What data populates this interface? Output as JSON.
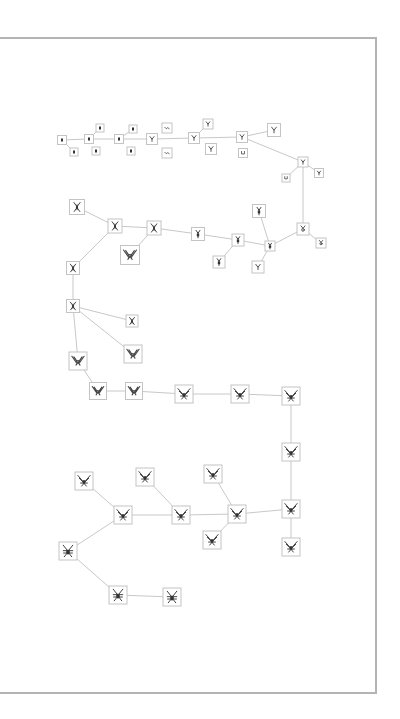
{
  "diagram": {
    "type": "evolution-tree",
    "frame": {
      "border_color": "#b4b4b4",
      "background": "#ffffff"
    },
    "edge_color": "#c8c8c8",
    "node_border_color": "#c4c4c4",
    "glyph_color": "#333333",
    "nodes": [
      {
        "id": "n1",
        "x": 62,
        "y": 140,
        "size": 8,
        "form": "dot"
      },
      {
        "id": "n2",
        "x": 89,
        "y": 139,
        "size": 8,
        "form": "dot"
      },
      {
        "id": "n3",
        "x": 100,
        "y": 128,
        "size": 7,
        "form": "dot"
      },
      {
        "id": "n4",
        "x": 74,
        "y": 152,
        "size": 7,
        "form": "dot"
      },
      {
        "id": "n5",
        "x": 96,
        "y": 151,
        "size": 7,
        "form": "dot"
      },
      {
        "id": "n6",
        "x": 119,
        "y": 139,
        "size": 8,
        "form": "dot"
      },
      {
        "id": "n7",
        "x": 133,
        "y": 129,
        "size": 7,
        "form": "dot"
      },
      {
        "id": "n8",
        "x": 131,
        "y": 151,
        "size": 7,
        "form": "dot"
      },
      {
        "id": "n9",
        "x": 152,
        "y": 139,
        "size": 10,
        "form": "y"
      },
      {
        "id": "n10",
        "x": 167,
        "y": 128,
        "size": 9,
        "form": "wave"
      },
      {
        "id": "n11",
        "x": 167,
        "y": 153,
        "size": 9,
        "form": "wave"
      },
      {
        "id": "n12",
        "x": 194,
        "y": 138,
        "size": 10,
        "form": "y"
      },
      {
        "id": "n13",
        "x": 208,
        "y": 124,
        "size": 9,
        "form": "y"
      },
      {
        "id": "n14",
        "x": 211,
        "y": 149,
        "size": 10,
        "form": "y"
      },
      {
        "id": "n15",
        "x": 242,
        "y": 137,
        "size": 10,
        "form": "y"
      },
      {
        "id": "n16",
        "x": 243,
        "y": 153,
        "size": 8,
        "form": "u"
      },
      {
        "id": "n17",
        "x": 274,
        "y": 130,
        "size": 12,
        "form": "y"
      },
      {
        "id": "n18",
        "x": 303,
        "y": 162,
        "size": 9,
        "form": "y"
      },
      {
        "id": "n19",
        "x": 286,
        "y": 178,
        "size": 7,
        "form": "u"
      },
      {
        "id": "n20",
        "x": 319,
        "y": 173,
        "size": 8,
        "form": "y"
      },
      {
        "id": "n21",
        "x": 303,
        "y": 229,
        "size": 11,
        "form": "ring"
      },
      {
        "id": "n22",
        "x": 321,
        "y": 243,
        "size": 9,
        "form": "ring"
      },
      {
        "id": "n23",
        "x": 270,
        "y": 246,
        "size": 9,
        "form": "stick"
      },
      {
        "id": "n24",
        "x": 259,
        "y": 211,
        "size": 12,
        "form": "stick"
      },
      {
        "id": "n25",
        "x": 258,
        "y": 267,
        "size": 11,
        "form": "y"
      },
      {
        "id": "n26",
        "x": 238,
        "y": 240,
        "size": 11,
        "form": "stick"
      },
      {
        "id": "n27",
        "x": 219,
        "y": 262,
        "size": 11,
        "form": "stick"
      },
      {
        "id": "n28",
        "x": 198,
        "y": 234,
        "size": 12,
        "form": "stick"
      },
      {
        "id": "n29",
        "x": 154,
        "y": 228,
        "size": 13,
        "form": "spider"
      },
      {
        "id": "n30",
        "x": 130,
        "y": 255,
        "size": 18,
        "form": "wings"
      },
      {
        "id": "n31",
        "x": 115,
        "y": 226,
        "size": 13,
        "form": "spider"
      },
      {
        "id": "n32",
        "x": 77,
        "y": 207,
        "size": 14,
        "form": "spider"
      },
      {
        "id": "n33",
        "x": 73,
        "y": 268,
        "size": 12,
        "form": "spider"
      },
      {
        "id": "n34",
        "x": 73,
        "y": 306,
        "size": 12,
        "form": "spider"
      },
      {
        "id": "n35",
        "x": 132,
        "y": 321,
        "size": 11,
        "form": "spider"
      },
      {
        "id": "n36",
        "x": 133,
        "y": 354,
        "size": 17,
        "form": "wings"
      },
      {
        "id": "n37",
        "x": 78,
        "y": 361,
        "size": 17,
        "form": "wings"
      },
      {
        "id": "n38",
        "x": 98,
        "y": 391,
        "size": 16,
        "form": "wings"
      },
      {
        "id": "n39",
        "x": 134,
        "y": 391,
        "size": 16,
        "form": "wings"
      },
      {
        "id": "n40",
        "x": 184,
        "y": 394,
        "size": 17,
        "form": "bug"
      },
      {
        "id": "n41",
        "x": 240,
        "y": 394,
        "size": 17,
        "form": "bug"
      },
      {
        "id": "n42",
        "x": 291,
        "y": 396,
        "size": 17,
        "form": "bug"
      },
      {
        "id": "n43",
        "x": 291,
        "y": 452,
        "size": 17,
        "form": "bug"
      },
      {
        "id": "n44",
        "x": 291,
        "y": 509,
        "size": 17,
        "form": "bug"
      },
      {
        "id": "n45",
        "x": 291,
        "y": 547,
        "size": 17,
        "form": "bug"
      },
      {
        "id": "n46",
        "x": 237,
        "y": 514,
        "size": 17,
        "form": "bug"
      },
      {
        "id": "n47",
        "x": 213,
        "y": 474,
        "size": 17,
        "form": "bug"
      },
      {
        "id": "n48",
        "x": 212,
        "y": 540,
        "size": 17,
        "form": "bug"
      },
      {
        "id": "n49",
        "x": 181,
        "y": 515,
        "size": 17,
        "form": "bug"
      },
      {
        "id": "n50",
        "x": 145,
        "y": 477,
        "size": 17,
        "form": "bug"
      },
      {
        "id": "n51",
        "x": 123,
        "y": 515,
        "size": 17,
        "form": "bug"
      },
      {
        "id": "n52",
        "x": 84,
        "y": 481,
        "size": 17,
        "form": "bug"
      },
      {
        "id": "n53",
        "x": 68,
        "y": 551,
        "size": 17,
        "form": "beetle"
      },
      {
        "id": "n54",
        "x": 118,
        "y": 595,
        "size": 17,
        "form": "beetle"
      },
      {
        "id": "n55",
        "x": 172,
        "y": 597,
        "size": 17,
        "form": "beetle"
      }
    ],
    "edges": [
      [
        "n1",
        "n2"
      ],
      [
        "n1",
        "n4"
      ],
      [
        "n2",
        "n3"
      ],
      [
        "n2",
        "n6"
      ],
      [
        "n6",
        "n7"
      ],
      [
        "n6",
        "n9"
      ],
      [
        "n9",
        "n12"
      ],
      [
        "n12",
        "n13"
      ],
      [
        "n12",
        "n15"
      ],
      [
        "n15",
        "n17"
      ],
      [
        "n15",
        "n18"
      ],
      [
        "n18",
        "n19"
      ],
      [
        "n18",
        "n20"
      ],
      [
        "n18",
        "n21"
      ],
      [
        "n21",
        "n22"
      ],
      [
        "n21",
        "n23"
      ],
      [
        "n23",
        "n24"
      ],
      [
        "n23",
        "n25"
      ],
      [
        "n23",
        "n26"
      ],
      [
        "n26",
        "n27"
      ],
      [
        "n26",
        "n28"
      ],
      [
        "n28",
        "n29"
      ],
      [
        "n29",
        "n30"
      ],
      [
        "n29",
        "n31"
      ],
      [
        "n31",
        "n32"
      ],
      [
        "n31",
        "n33"
      ],
      [
        "n33",
        "n34"
      ],
      [
        "n34",
        "n35"
      ],
      [
        "n34",
        "n36"
      ],
      [
        "n34",
        "n37"
      ],
      [
        "n37",
        "n38"
      ],
      [
        "n38",
        "n39"
      ],
      [
        "n39",
        "n40"
      ],
      [
        "n40",
        "n41"
      ],
      [
        "n41",
        "n42"
      ],
      [
        "n42",
        "n43"
      ],
      [
        "n43",
        "n44"
      ],
      [
        "n44",
        "n45"
      ],
      [
        "n44",
        "n46"
      ],
      [
        "n46",
        "n47"
      ],
      [
        "n46",
        "n48"
      ],
      [
        "n46",
        "n49"
      ],
      [
        "n49",
        "n50"
      ],
      [
        "n49",
        "n51"
      ],
      [
        "n51",
        "n52"
      ],
      [
        "n51",
        "n53"
      ],
      [
        "n53",
        "n54"
      ],
      [
        "n54",
        "n55"
      ]
    ]
  }
}
